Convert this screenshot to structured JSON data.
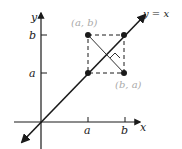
{
  "diagram": {
    "axes": {
      "x_label": "x",
      "y_label": "y"
    },
    "ticks": {
      "x": [
        {
          "label": "a"
        },
        {
          "label": "b"
        }
      ],
      "y": [
        {
          "label": "a"
        },
        {
          "label": "b"
        }
      ]
    },
    "line_label": "y = x",
    "points": [
      {
        "label": "(a, b)",
        "color": "#aaaaaa"
      },
      {
        "label": "(b, a)",
        "color": "#aaaaaa"
      }
    ],
    "colors": {
      "ink": "#1a1a1a",
      "point_label": "#aaaaaa"
    }
  }
}
